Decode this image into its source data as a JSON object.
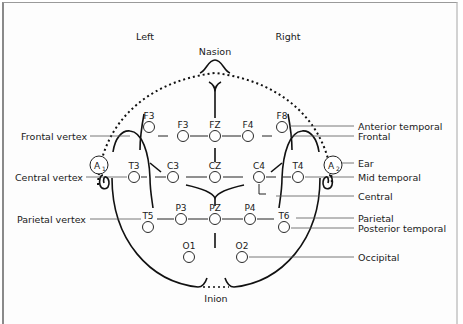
{
  "diagram": {
    "title_left": "Left",
    "title_right": "Right",
    "landmarks": {
      "nasion": "Nasion",
      "inion": "Inion"
    },
    "ears": [
      {
        "id": "A1",
        "label": "A",
        "sub": "1",
        "x": 99,
        "y": 165
      },
      {
        "id": "A2",
        "label": "A",
        "sub": "2",
        "x": 333,
        "y": 165
      }
    ],
    "electrodes": [
      {
        "label": "F3",
        "x": 149,
        "y": 127,
        "lx": 149,
        "ly": 118
      },
      {
        "label": "F3",
        "x": 183,
        "y": 136,
        "lx": 183,
        "ly": 127
      },
      {
        "label": "FZ",
        "x": 215,
        "y": 136,
        "lx": 215,
        "ly": 127
      },
      {
        "label": "F4",
        "x": 248,
        "y": 136,
        "lx": 248,
        "ly": 127
      },
      {
        "label": "F8",
        "x": 282,
        "y": 127,
        "lx": 282,
        "ly": 118
      },
      {
        "label": "T3",
        "x": 134,
        "y": 177,
        "lx": 134,
        "ly": 168
      },
      {
        "label": "C3",
        "x": 173,
        "y": 177,
        "lx": 173,
        "ly": 168
      },
      {
        "label": "CZ",
        "x": 215,
        "y": 177,
        "lx": 215,
        "ly": 168
      },
      {
        "label": "C4",
        "x": 259,
        "y": 177,
        "lx": 259,
        "ly": 168
      },
      {
        "label": "T4",
        "x": 298,
        "y": 177,
        "lx": 298,
        "ly": 168
      },
      {
        "label": "T5",
        "x": 148,
        "y": 227,
        "lx": 148,
        "ly": 218
      },
      {
        "label": "P3",
        "x": 181,
        "y": 219,
        "lx": 181,
        "ly": 210
      },
      {
        "label": "PZ",
        "x": 215,
        "y": 219,
        "lx": 215,
        "ly": 210
      },
      {
        "label": "P4",
        "x": 250,
        "y": 219,
        "lx": 250,
        "ly": 210
      },
      {
        "label": "T6",
        "x": 284,
        "y": 227,
        "lx": 284,
        "ly": 218
      },
      {
        "label": "O1",
        "x": 189,
        "y": 257,
        "lx": 189,
        "ly": 248
      },
      {
        "label": "O2",
        "x": 242,
        "y": 257,
        "lx": 242,
        "ly": 248
      }
    ],
    "left_labels": [
      {
        "text": "Frontal vertex",
        "y": 136
      },
      {
        "text": "Central vertex",
        "y": 177
      },
      {
        "text": "Parietal vertex",
        "y": 219
      }
    ],
    "right_labels": [
      {
        "text": "Anterior temporal",
        "y": 126
      },
      {
        "text": "Frontal",
        "y": 136
      },
      {
        "text": "Ear",
        "y": 163
      },
      {
        "text": "Mid temporal",
        "y": 177
      },
      {
        "text": "Central",
        "y": 196
      },
      {
        "text": "Parietal",
        "y": 218
      },
      {
        "text": "Posterior temporal",
        "y": 228
      },
      {
        "text": "Occipital",
        "y": 257
      }
    ]
  }
}
